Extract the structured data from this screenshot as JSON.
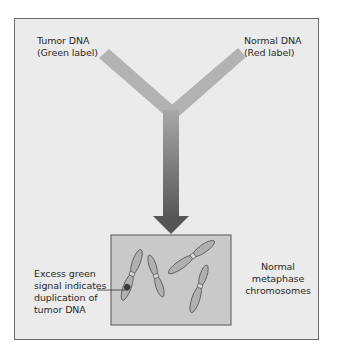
{
  "labels": {
    "tumor_dna": "Tumor DNA\n(Green label)",
    "normal_dna": "Normal DNA\n(Red label)",
    "excess_signal": "Excess green\nsignal indicates\nduplication of\ntumor DNA",
    "normal_chromosomes": "Normal\nmetaphase\nchromosomes"
  },
  "colors": {
    "frame_bg": "#ebebeb",
    "frame_border": "#6a6a6a",
    "arm_light": "#b4b4b4",
    "arrow_dark": "#555555",
    "box_bg": "#c9c9c9",
    "chromosome_fill": "#b0b0b0",
    "excess_signal_dot": "#3a3a3a"
  }
}
